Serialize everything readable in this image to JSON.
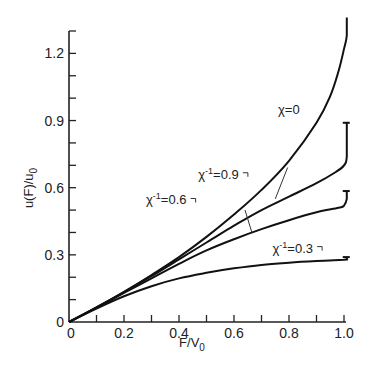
{
  "chart_data": {
    "type": "line",
    "title": "",
    "xlabel": "F/V",
    "xlabel_sub": "0",
    "ylabel": "u(F)/u",
    "ylabel_sub": "0",
    "xlim": [
      0,
      1.0
    ],
    "ylim": [
      0,
      1.3
    ],
    "grid": false,
    "x_ticks": [
      0,
      0.1,
      0.2,
      0.3,
      0.4,
      0.5,
      0.6,
      0.7,
      0.8,
      0.9,
      1.0
    ],
    "x_tick_labels": [
      {
        "value": 0,
        "label": "0"
      },
      {
        "value": 0.2,
        "label": "0.2"
      },
      {
        "value": 0.4,
        "label": "0.4"
      },
      {
        "value": 0.6,
        "label": "0.6"
      },
      {
        "value": 0.8,
        "label": "0.8"
      },
      {
        "value": 1.0,
        "label": "1.0"
      }
    ],
    "y_ticks": [
      0,
      0.1,
      0.2,
      0.3,
      0.4,
      0.5,
      0.6,
      0.7,
      0.8,
      0.9,
      1.0,
      1.1,
      1.2,
      1.3
    ],
    "y_tick_labels": [
      {
        "value": 0,
        "label": "0"
      },
      {
        "value": 0.3,
        "label": "0.3"
      },
      {
        "value": 0.6,
        "label": "0.6"
      },
      {
        "value": 0.9,
        "label": "0.9"
      },
      {
        "value": 1.2,
        "label": "1.2"
      }
    ],
    "series": [
      {
        "name": "chi=0",
        "label_main": "χ=0",
        "label_sup": "",
        "label_pos": [
          0.76,
          0.93
        ],
        "cap": false,
        "points": [
          [
            0,
            0
          ],
          [
            0.1,
            0.065
          ],
          [
            0.2,
            0.135
          ],
          [
            0.3,
            0.21
          ],
          [
            0.4,
            0.29
          ],
          [
            0.5,
            0.38
          ],
          [
            0.6,
            0.48
          ],
          [
            0.7,
            0.59
          ],
          [
            0.8,
            0.72
          ],
          [
            0.9,
            0.89
          ],
          [
            0.95,
            1.01
          ],
          [
            0.98,
            1.12
          ],
          [
            1.0,
            1.22
          ],
          [
            1.01,
            1.28
          ],
          [
            1.01,
            1.36
          ]
        ]
      },
      {
        "name": "chi^-1=0.9",
        "label_main": "χ",
        "label_sup": "-1",
        "label_rest": "=0.9",
        "label_pos": [
          0.47,
          0.64
        ],
        "leader": [
          [
            0.795,
            0.69
          ],
          [
            0.75,
            0.55
          ]
        ],
        "cap": true,
        "points": [
          [
            0,
            0
          ],
          [
            0.1,
            0.065
          ],
          [
            0.2,
            0.133
          ],
          [
            0.3,
            0.205
          ],
          [
            0.4,
            0.28
          ],
          [
            0.5,
            0.355
          ],
          [
            0.6,
            0.43
          ],
          [
            0.7,
            0.5
          ],
          [
            0.8,
            0.56
          ],
          [
            0.9,
            0.62
          ],
          [
            0.97,
            0.67
          ],
          [
            1.0,
            0.7
          ],
          [
            1.01,
            0.74
          ],
          [
            1.01,
            0.89
          ]
        ]
      },
      {
        "name": "chi^-1=0.6",
        "label_main": "χ",
        "label_sup": "-1",
        "label_rest": "=0.6",
        "label_pos": [
          0.28,
          0.525
        ],
        "leader": [
          [
            0.64,
            0.5
          ],
          [
            0.665,
            0.4
          ]
        ],
        "cap": true,
        "points": [
          [
            0,
            0
          ],
          [
            0.1,
            0.064
          ],
          [
            0.2,
            0.13
          ],
          [
            0.3,
            0.195
          ],
          [
            0.4,
            0.26
          ],
          [
            0.5,
            0.32
          ],
          [
            0.6,
            0.37
          ],
          [
            0.7,
            0.415
          ],
          [
            0.8,
            0.455
          ],
          [
            0.9,
            0.49
          ],
          [
            0.98,
            0.51
          ],
          [
            1.0,
            0.52
          ],
          [
            1.01,
            0.55
          ],
          [
            1.01,
            0.585
          ]
        ]
      },
      {
        "name": "chi^-1=0.3",
        "label_main": "χ",
        "label_sup": "-1",
        "label_rest": "=0.3",
        "label_pos": [
          0.74,
          0.31
        ],
        "cap": true,
        "points": [
          [
            0,
            0
          ],
          [
            0.1,
            0.06
          ],
          [
            0.2,
            0.115
          ],
          [
            0.3,
            0.16
          ],
          [
            0.4,
            0.195
          ],
          [
            0.5,
            0.22
          ],
          [
            0.6,
            0.24
          ],
          [
            0.7,
            0.255
          ],
          [
            0.8,
            0.265
          ],
          [
            0.9,
            0.272
          ],
          [
            1.0,
            0.278
          ],
          [
            1.01,
            0.28
          ],
          [
            1.01,
            0.29
          ]
        ]
      }
    ]
  }
}
